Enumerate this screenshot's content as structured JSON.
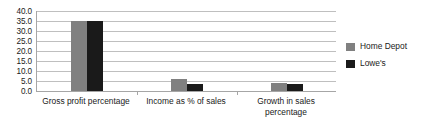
{
  "chart_data": {
    "type": "bar",
    "title": "",
    "xlabel": "",
    "ylabel": "",
    "grid": true,
    "legend_position": "right",
    "ylim": [
      0.0,
      40.0
    ],
    "ytick_step": 5.0,
    "ytick_labels": [
      "40.0",
      "35.0",
      "30.0",
      "25.0",
      "20.0",
      "15.0",
      "10.0",
      "5.0",
      "0.0"
    ],
    "ytick_values": [
      40.0,
      35.0,
      30.0,
      25.0,
      20.0,
      15.0,
      10.0,
      5.0,
      0.0
    ],
    "categories": [
      "Gross profit percentage",
      "Income as % of sales",
      "Growth in sales percentage"
    ],
    "series": [
      {
        "name": "Home Depot",
        "color": "#808080",
        "values": [
          35.0,
          6.2,
          4.0
        ]
      },
      {
        "name": "Lowe's",
        "color": "#1a1a1a",
        "values": [
          35.0,
          3.6,
          3.3
        ]
      }
    ]
  },
  "legend": {
    "items": [
      {
        "label": "Home Depot",
        "color": "#808080"
      },
      {
        "label": "Lowe's",
        "color": "#1a1a1a"
      }
    ]
  },
  "axis": {
    "line_color": "#a6a6a6",
    "grid_color": "#bfbfbf"
  }
}
